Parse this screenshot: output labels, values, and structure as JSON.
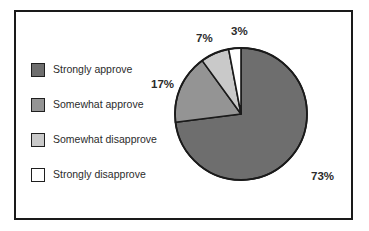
{
  "chart_data": {
    "type": "pie",
    "title": "",
    "subtitle": "",
    "xlabel": "",
    "ylabel": "",
    "grid": false,
    "legend_position": "left",
    "start_angle_deg": 0,
    "direction": "clockwise",
    "categories": [
      "Strongly approve",
      "Somewhat approve",
      "Somewhat disapprove",
      "Strongly disapprove"
    ],
    "values": [
      73,
      17,
      7,
      3
    ],
    "value_labels": [
      "73%",
      "17%",
      "7%",
      "3%"
    ],
    "colors": [
      "#6e6e6e",
      "#949494",
      "#c9c9c9",
      "#ffffff"
    ],
    "slice_outline_color": "#1a1a1a",
    "units": "percent",
    "total": 100,
    "slices": [
      {
        "label": "Strongly approve",
        "value": 73,
        "display": "73%",
        "color": "#6e6e6e"
      },
      {
        "label": "Somewhat approve",
        "value": 17,
        "display": "17%",
        "color": "#949494"
      },
      {
        "label": "Somewhat disapprove",
        "value": 7,
        "display": "7%",
        "color": "#c9c9c9"
      },
      {
        "label": "Strongly disapprove",
        "value": 3,
        "display": "3%",
        "color": "#ffffff"
      }
    ]
  },
  "legend": {
    "items": [
      {
        "label": "Strongly approve",
        "color": "#6e6e6e"
      },
      {
        "label": "Somewhat approve",
        "color": "#949494"
      },
      {
        "label": "Somewhat disapprove",
        "color": "#c9c9c9"
      },
      {
        "label": "Strongly disapprove",
        "color": "#ffffff"
      }
    ]
  },
  "frame": {
    "border_color": "#1a1a1a",
    "background_color": "#ffffff"
  }
}
